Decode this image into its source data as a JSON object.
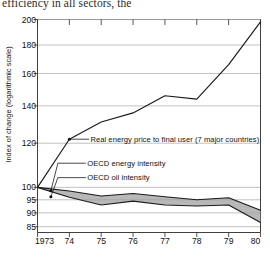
{
  "caption": "efficiency in all sectors, the",
  "chart_data": {
    "type": "line",
    "title": "",
    "xlabel": "",
    "ylabel": "Index of change (logarithmic scale)",
    "scale": "logarithmic",
    "grid": true,
    "legend_position": "inline-annotations",
    "ylim": [
      83,
      200
    ],
    "yticks": [
      200,
      180,
      160,
      140,
      120,
      100,
      95,
      90,
      85
    ],
    "ytick_labels": [
      "200",
      "180",
      "160",
      "140",
      "120",
      "100",
      "95",
      "90",
      "85"
    ],
    "x": [
      1973,
      1974,
      1975,
      1976,
      1977,
      1978,
      1979,
      1980
    ],
    "xtick_labels": [
      "1973",
      "74",
      "75",
      "76",
      "77",
      "78",
      "79",
      "80"
    ],
    "series": [
      {
        "name": "Real energy price to final user (7 major countries)",
        "values": [
          100,
          122,
          131,
          136,
          146,
          144,
          166,
          198
        ],
        "color": "#1a1a1a",
        "style": "line"
      },
      {
        "name": "OECD energy intensity",
        "values": [
          100,
          98.5,
          96.5,
          97.5,
          96.2,
          95.0,
          95.8,
          91.0
        ],
        "color": "#1a1a1a",
        "style": "line"
      },
      {
        "name": "OECD oil intensity",
        "values": [
          100,
          96.0,
          93.0,
          94.5,
          93.0,
          92.6,
          93.0,
          86.5
        ],
        "color": "#1a1a1a",
        "style": "line"
      }
    ],
    "band": {
      "between": [
        "OECD energy intensity",
        "OECD oil intensity"
      ],
      "fill": "#9c9c9c"
    },
    "annotations": [
      {
        "text": "Real energy price to final user (7 major countries)",
        "anchor_x": 1974.0,
        "anchor_y": 122
      },
      {
        "text": "OECD energy intensity",
        "anchor_x": 1973.45,
        "anchor_y": 98.6
      },
      {
        "text": "OECD oil intensity",
        "anchor_x": 1973.45,
        "anchor_y": 96.2
      }
    ]
  }
}
